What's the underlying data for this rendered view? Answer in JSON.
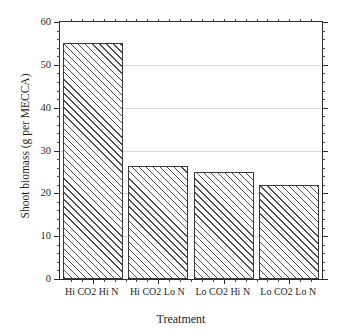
{
  "figure": {
    "top_clipped_caption": "",
    "background_color": "#ffffff",
    "bar_edge_color": "#3a3a3a",
    "hatch_color": "#4d4d4d",
    "axis_color": "#2b2b2b",
    "grid_color": "#d9d9d9"
  },
  "chart_data": {
    "type": "bar",
    "title": "",
    "xlabel": "Treatment",
    "ylabel": "Shoot biomass (g per MECCA)",
    "categories": [
      "Hi CO2 Hi N",
      "Hi CO2 Lo N",
      "Lo CO2 Hi N",
      "Lo CO2 Lo N"
    ],
    "values": [
      55,
      26.5,
      25,
      22
    ],
    "ylim": [
      0,
      60
    ],
    "ytick_labels": [
      "0",
      "10",
      "20",
      "30",
      "40",
      "50",
      "60"
    ],
    "ytick_values": [
      0,
      10,
      20,
      30,
      40,
      50,
      60
    ],
    "yminor_step": 2,
    "grid": "horizontal-major-faint",
    "legend": "none",
    "hatch": "diagonal-lines",
    "series": [
      {
        "name": "Shoot biomass",
        "values": [
          55,
          26.5,
          25,
          22
        ]
      }
    ]
  }
}
